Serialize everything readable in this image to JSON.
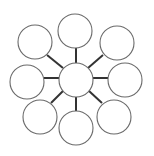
{
  "diagram": {
    "type": "bubble-map",
    "width": 154,
    "height": 156,
    "colors": {
      "background": "#ffffff",
      "circle_stroke": "#6a6a6a",
      "connector": "#333333"
    },
    "center": {
      "id": "center",
      "cx": 76,
      "cy": 80,
      "r": 17,
      "label": ""
    },
    "nodes": [
      {
        "id": "top",
        "cx": 75,
        "cy": 31,
        "r": 17,
        "label": ""
      },
      {
        "id": "top-right",
        "cx": 117,
        "cy": 43,
        "r": 17,
        "label": ""
      },
      {
        "id": "right",
        "cx": 125,
        "cy": 80,
        "r": 17,
        "label": ""
      },
      {
        "id": "bottom-right",
        "cx": 114,
        "cy": 117,
        "r": 17,
        "label": ""
      },
      {
        "id": "bottom",
        "cx": 76,
        "cy": 128,
        "r": 17,
        "label": ""
      },
      {
        "id": "bottom-left",
        "cx": 40,
        "cy": 117,
        "r": 17,
        "label": ""
      },
      {
        "id": "left",
        "cx": 27,
        "cy": 82,
        "r": 17,
        "label": ""
      },
      {
        "id": "top-left",
        "cx": 35,
        "cy": 42,
        "r": 17,
        "label": ""
      }
    ],
    "connectors": [
      {
        "id": "to-top",
        "x1": 76,
        "y1": 64,
        "x2": 76,
        "y2": 48
      },
      {
        "id": "to-top-right",
        "x1": 88,
        "y1": 68,
        "x2": 103,
        "y2": 55
      },
      {
        "id": "to-right",
        "x1": 93,
        "y1": 78,
        "x2": 108,
        "y2": 78
      },
      {
        "id": "to-bottom-right",
        "x1": 89,
        "y1": 91,
        "x2": 102,
        "y2": 103
      },
      {
        "id": "to-bottom",
        "x1": 76,
        "y1": 97,
        "x2": 76,
        "y2": 111
      },
      {
        "id": "to-bottom-left",
        "x1": 63,
        "y1": 91,
        "x2": 51,
        "y2": 103
      },
      {
        "id": "to-left",
        "x1": 59,
        "y1": 78,
        "x2": 44,
        "y2": 78
      },
      {
        "id": "to-top-left",
        "x1": 63,
        "y1": 68,
        "x2": 47,
        "y2": 55
      }
    ]
  }
}
